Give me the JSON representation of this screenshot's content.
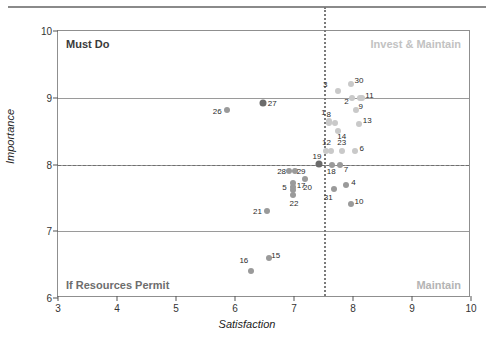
{
  "chart_data": {
    "type": "scatter",
    "title": "",
    "xlabel": "Satisfaction",
    "ylabel": "Importance",
    "xlim": [
      3,
      10
    ],
    "ylim": [
      6,
      10
    ],
    "xticks": [
      3,
      4,
      5,
      6,
      7,
      8,
      9,
      10
    ],
    "yticks": [
      6,
      7,
      8,
      9,
      10
    ],
    "gridlines": {
      "horizontal": [
        7,
        8,
        9
      ],
      "vertical": []
    },
    "reference_lines": {
      "vertical_x": 7.5,
      "vertical_style": "dotted",
      "horizontal_y": 8.0,
      "horizontal_style": "dashed"
    },
    "quadrant_labels": {
      "top_left": "Must Do",
      "top_right": "Invest & Maintain",
      "bottom_left": "If Resources Permit",
      "bottom_right": "Maintain"
    },
    "legend": null,
    "colors": {
      "dark_marker": "#6b6b6b",
      "mid_marker": "#9a9a9a",
      "light_marker": "#c9c9c9",
      "axis": "#8f8f8f",
      "grid": "#9a9a9a",
      "text": "#2b2b2b",
      "quad_dark": "#3a3a3a",
      "quad_light": "#c2c2c2"
    },
    "points": [
      {
        "label": "1",
        "x": 7.6,
        "y": 8.65,
        "tone": "light",
        "size": 6,
        "lx": 7.5,
        "ly": 8.79
      },
      {
        "label": "2",
        "x": 7.98,
        "y": 9.0,
        "tone": "light",
        "size": 6,
        "lx": 7.89,
        "ly": 8.95
      },
      {
        "label": "3",
        "x": 7.75,
        "y": 9.1,
        "tone": "light",
        "size": 6,
        "lx": 7.53,
        "ly": 9.2
      },
      {
        "label": "4",
        "x": 7.88,
        "y": 7.7,
        "tone": "mid",
        "size": 6,
        "lx": 8.01,
        "ly": 7.74
      },
      {
        "label": "5",
        "x": 6.98,
        "y": 7.66,
        "tone": "mid",
        "size": 6,
        "lx": 6.84,
        "ly": 7.66
      },
      {
        "label": "6",
        "x": 8.03,
        "y": 8.2,
        "tone": "light",
        "size": 6,
        "lx": 8.15,
        "ly": 8.25
      },
      {
        "label": "7",
        "x": 7.78,
        "y": 8.0,
        "tone": "mid",
        "size": 6,
        "lx": 7.88,
        "ly": 7.93
      },
      {
        "label": "8",
        "x": 7.6,
        "y": 8.62,
        "tone": "light",
        "size": 6,
        "lx": 7.59,
        "ly": 8.76
      },
      {
        "label": "9",
        "x": 8.05,
        "y": 8.82,
        "tone": "light",
        "size": 6,
        "lx": 8.13,
        "ly": 8.87
      },
      {
        "label": "10",
        "x": 7.97,
        "y": 7.41,
        "tone": "mid",
        "size": 6,
        "lx": 8.1,
        "ly": 7.45
      },
      {
        "label": "11",
        "x": 8.15,
        "y": 9.0,
        "tone": "light",
        "size": 6,
        "lx": 8.28,
        "ly": 9.04
      },
      {
        "label": "12",
        "x": 7.62,
        "y": 8.2,
        "tone": "light",
        "size": 6,
        "lx": 7.55,
        "ly": 8.33
      },
      {
        "label": "13",
        "x": 8.1,
        "y": 8.61,
        "tone": "light",
        "size": 6,
        "lx": 8.24,
        "ly": 8.66
      },
      {
        "label": "14",
        "x": 7.75,
        "y": 8.5,
        "tone": "light",
        "size": 6,
        "lx": 7.81,
        "ly": 8.43
      },
      {
        "label": "15",
        "x": 6.57,
        "y": 6.6,
        "tone": "mid",
        "size": 6,
        "lx": 6.69,
        "ly": 6.65
      },
      {
        "label": "16",
        "x": 6.27,
        "y": 6.4,
        "tone": "mid",
        "size": 6,
        "lx": 6.15,
        "ly": 6.57
      },
      {
        "label": "17",
        "x": 6.99,
        "y": 7.73,
        "tone": "mid",
        "size": 6,
        "lx": 7.12,
        "ly": 7.7
      },
      {
        "label": "18",
        "x": 7.65,
        "y": 8.0,
        "tone": "mid",
        "size": 6,
        "lx": 7.63,
        "ly": 7.9
      },
      {
        "label": "19",
        "x": 7.42,
        "y": 8.01,
        "tone": "dark",
        "size": 7,
        "lx": 7.39,
        "ly": 8.13
      },
      {
        "label": "20",
        "x": 7.18,
        "y": 7.79,
        "tone": "mid",
        "size": 6,
        "lx": 7.23,
        "ly": 7.66
      },
      {
        "label": "21",
        "x": 6.55,
        "y": 7.3,
        "tone": "mid",
        "size": 6,
        "lx": 6.38,
        "ly": 7.3
      },
      {
        "label": "22",
        "x": 6.99,
        "y": 7.55,
        "tone": "mid",
        "size": 6,
        "lx": 7.0,
        "ly": 7.42
      },
      {
        "label": "23",
        "x": 7.82,
        "y": 8.2,
        "tone": "light",
        "size": 6,
        "lx": 7.81,
        "ly": 8.33
      },
      {
        "label": "26",
        "x": 5.87,
        "y": 8.82,
        "tone": "mid",
        "size": 6,
        "lx": 5.7,
        "ly": 8.8
      },
      {
        "label": "27",
        "x": 6.48,
        "y": 8.92,
        "tone": "dark",
        "size": 7,
        "lx": 6.63,
        "ly": 8.92
      },
      {
        "label": "28",
        "x": 6.92,
        "y": 7.91,
        "tone": "mid",
        "size": 6,
        "lx": 6.79,
        "ly": 7.91
      },
      {
        "label": "29",
        "x": 7.02,
        "y": 7.91,
        "tone": "mid",
        "size": 6,
        "lx": 7.12,
        "ly": 7.9
      },
      {
        "label": "30",
        "x": 7.97,
        "y": 9.2,
        "tone": "light",
        "size": 6,
        "lx": 8.1,
        "ly": 9.27
      },
      {
        "label": "31",
        "x": 7.68,
        "y": 7.63,
        "tone": "mid",
        "size": 6,
        "lx": 7.58,
        "ly": 7.52
      },
      {
        "label": "",
        "x": 7.55,
        "y": 8.2,
        "tone": "light",
        "size": 6,
        "lx": null,
        "ly": null
      },
      {
        "label": "",
        "x": 7.7,
        "y": 8.62,
        "tone": "light",
        "size": 6,
        "lx": null,
        "ly": null
      },
      {
        "label": "",
        "x": 6.99,
        "y": 7.62,
        "tone": "mid",
        "size": 6,
        "lx": null,
        "ly": null
      },
      {
        "label": "",
        "x": 8.12,
        "y": 9.0,
        "tone": "light",
        "size": 6,
        "lx": null,
        "ly": null
      }
    ]
  }
}
